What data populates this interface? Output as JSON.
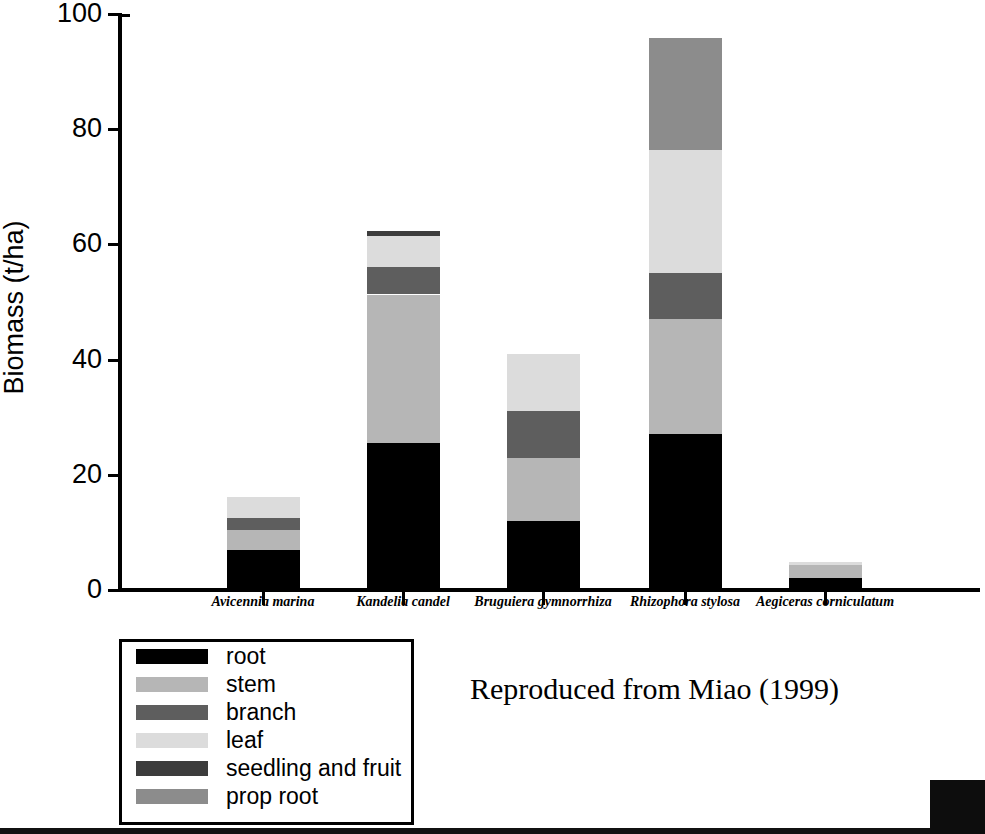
{
  "chart_data": {
    "type": "bar",
    "stacked": true,
    "title": "",
    "xlabel": "",
    "ylabel": "Biomass (t/ha)",
    "ylim": [
      0,
      100
    ],
    "yticks": [
      0,
      20,
      40,
      60,
      80,
      100
    ],
    "ytick_labels": [
      "0",
      "20",
      "40",
      "60",
      "80",
      "100"
    ],
    "grid": false,
    "legend_position": "below-left",
    "categories": [
      "Avicennia marina",
      "Kandelia candel",
      "Bruguiera gymnorrhiza",
      "Rhizophora stylosa",
      "Aegiceras corniculatum"
    ],
    "series": [
      {
        "name": "root",
        "color": "#000000",
        "values": [
          7.0,
          25.5,
          12.0,
          27.0,
          2.0
        ]
      },
      {
        "name": "stem",
        "color": "#b6b6b6",
        "values": [
          3.5,
          25.8,
          11.0,
          20.0,
          2.3
        ]
      },
      {
        "name": "branch",
        "color": "#5e5e5e",
        "values": [
          2.0,
          4.7,
          8.0,
          8.0,
          0.0
        ]
      },
      {
        "name": "leaf",
        "color": "#dcdcdc",
        "values": [
          3.7,
          5.5,
          10.0,
          21.4,
          0.5
        ]
      },
      {
        "name": "seedling and fruit",
        "color": "#3c3c3c",
        "values": [
          0.0,
          0.8,
          0.0,
          0.0,
          0.0
        ]
      },
      {
        "name": "prop root",
        "color": "#8c8c8c",
        "values": [
          0.0,
          0.0,
          0.0,
          19.4,
          0.0
        ]
      }
    ],
    "totals": [
      16.2,
      62.3,
      41.0,
      95.8,
      4.8
    ],
    "annotations": [
      "Reproduced from Miao (1999)"
    ]
  },
  "axis": {
    "ylabel": "Biomass (t/ha)"
  },
  "legend": {
    "items": [
      {
        "label": "root"
      },
      {
        "label": "stem"
      },
      {
        "label": "branch"
      },
      {
        "label": "leaf"
      },
      {
        "label": "seedling and fruit"
      },
      {
        "label": "prop root"
      }
    ]
  },
  "credit": {
    "text": "Reproduced from Miao (1999)"
  }
}
